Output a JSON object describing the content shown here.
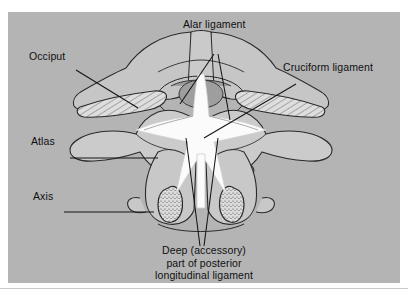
{
  "figure": {
    "panel_color": "#b4b4b4",
    "bone_fill": "#c4c4c4",
    "bone_light": "#cfcfcf",
    "ligament_color": "#fbfbfb",
    "dens_color": "#9b9b9b",
    "outline_color": "#2a2a2a",
    "label_color": "#101010"
  },
  "labels": {
    "alar": "Alar ligament",
    "occiput": "Occiput",
    "cruciform": "Cruciform ligament",
    "atlas": "Atlas",
    "axis": "Axis",
    "deep_line1": "Deep (accessory)",
    "deep_line2": "part of posterior",
    "deep_line3": "longitudinal ligament"
  }
}
